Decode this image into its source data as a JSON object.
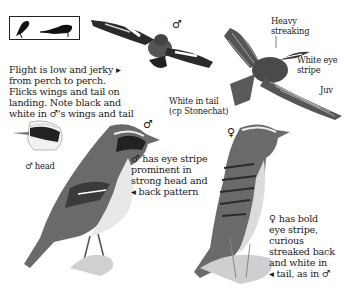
{
  "page": {
    "silhouette_box": {
      "icon": "perched-bird-silhouettes-icon"
    },
    "flight_note": {
      "lines": [
        "Flight is low and jerky ▸",
        "from perch to perch.",
        "Flicks wings and tail on",
        "landing. Note black and",
        "white in ♂'s wings and tail"
      ]
    },
    "male_flight": {
      "symbol": "♂"
    },
    "juvenile_flight": {
      "label_heavy": [
        "Heavy",
        "streaking"
      ],
      "label_eye": [
        "White eye",
        "stripe"
      ],
      "label_juv": "Juv"
    },
    "tail_note": {
      "lines": [
        "White in tail",
        "(cp Stonechat)"
      ]
    },
    "male_head": {
      "caption": "♂ head"
    },
    "male_perched": {
      "symbol": "♂",
      "note": [
        "♂ has eye stripe",
        "prominent in",
        "strong head and",
        "◂ back pattern"
      ]
    },
    "female_perched": {
      "symbol": "♀",
      "note": [
        "♀ has bold",
        "eye stripe,",
        "curious",
        "streaked back",
        "and white in",
        "◂ tail, as in ♂"
      ]
    },
    "colors": {
      "ink": "#1a1a1a",
      "paper": "#ffffff",
      "mid": "#6e6e6e",
      "light": "#cfcfcf"
    }
  }
}
